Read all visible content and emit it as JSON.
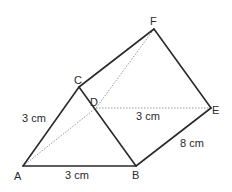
{
  "figure": {
    "type": "triangular-prism",
    "vertices": {
      "A": {
        "label": "A",
        "x": 23,
        "y": 166
      },
      "B": {
        "label": "B",
        "x": 136,
        "y": 166
      },
      "C": {
        "label": "C",
        "x": 79,
        "y": 87
      },
      "D": {
        "label": "D",
        "x": 96,
        "y": 108
      },
      "E": {
        "label": "E",
        "x": 211,
        "y": 108
      },
      "F": {
        "label": "F",
        "x": 154,
        "y": 29
      }
    },
    "solid_edges": [
      "AB",
      "AC",
      "CB",
      "CF",
      "FE",
      "BE"
    ],
    "hidden_edges": [
      "AD",
      "DE",
      "DF"
    ],
    "measurements": {
      "ac": "3 cm",
      "ab": "3 cm",
      "de": "3 cm",
      "be": "8 cm"
    }
  }
}
